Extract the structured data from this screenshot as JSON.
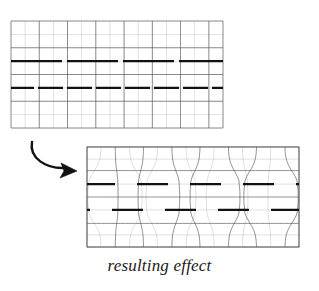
{
  "figure": {
    "caption": "resulting effect",
    "background_color": "#ffffff",
    "grid_line_color": "#8c8c8c",
    "grid_major_color": "#5a5a5a",
    "dark_line_color": "#111111",
    "arrow_color": "#111111"
  },
  "source_grid": {
    "name": "undistorted-grid",
    "x": 11,
    "y": 21,
    "width": 212,
    "height": 107,
    "columns": 15,
    "rows": 8,
    "major_every": 2,
    "dark_lines": [
      {
        "name": "upper-dark-line",
        "row_fraction": 0.375,
        "thickness": 2.1,
        "dash_pattern": "51,5",
        "dash_offset": 0
      },
      {
        "name": "lower-dark-line",
        "row_fraction": 0.625,
        "thickness": 2.1,
        "dash_pattern": "25,4",
        "dash_offset": 2
      }
    ]
  },
  "result_grid": {
    "name": "distorted-grid",
    "x": 87,
    "y": 147,
    "width": 212,
    "height": 100,
    "columns": 15,
    "rows": 8,
    "major_every": 2,
    "pinch_count": 4,
    "pinch_strength": 0.42,
    "dark_lines": [
      {
        "name": "upper-dark-line",
        "row_fraction": 0.375,
        "thickness": 2.1,
        "dash_pattern": "31,22",
        "dash_offset": 3
      },
      {
        "name": "lower-dark-line",
        "row_fraction": 0.625,
        "thickness": 2.1,
        "dash_pattern": "31,22",
        "dash_offset": 28
      }
    ]
  },
  "arrow": {
    "name": "transform-arrow",
    "label": "",
    "start_x": 32,
    "start_y": 142,
    "end_x": 74,
    "end_y": 170
  }
}
